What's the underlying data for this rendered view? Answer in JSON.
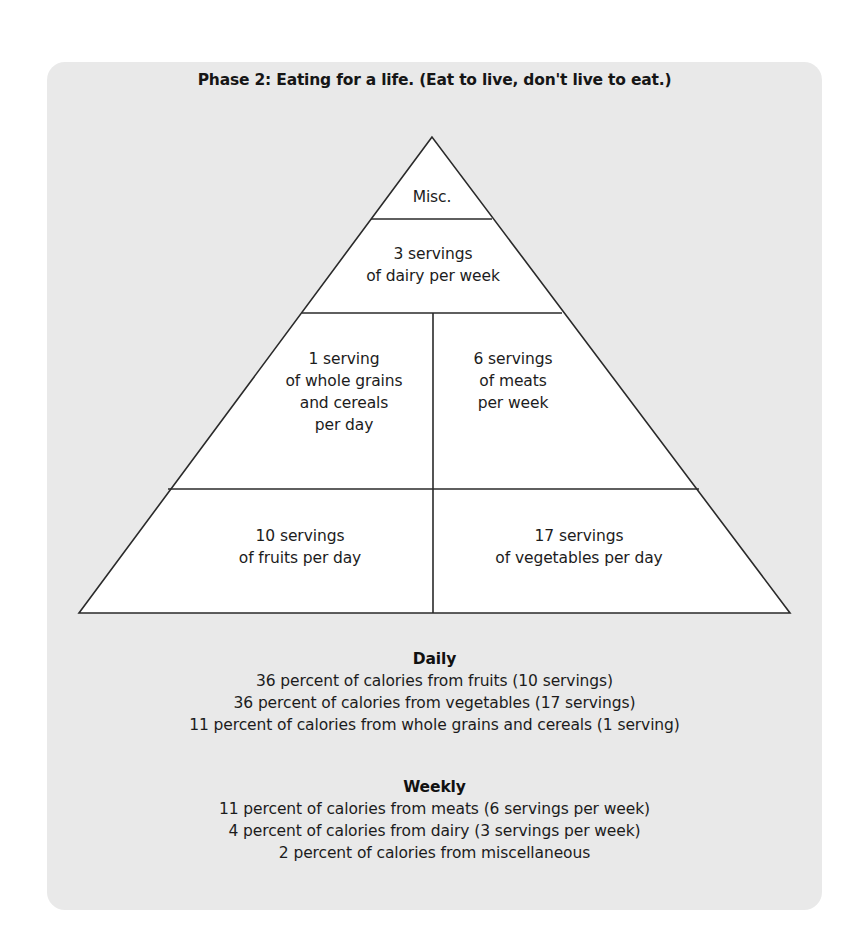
{
  "title": "Phase 2: Eating for a life. (Eat to live, don't live to eat.)",
  "colors": {
    "panel_background": "#e9e9e9",
    "pyramid_fill": "#ffffff",
    "stroke": "#2a2a2a",
    "text": "#1c1c1c"
  },
  "pyramid": {
    "tiers": [
      {
        "id": "misc",
        "lines": [
          "Misc."
        ]
      },
      {
        "id": "dairy",
        "lines": [
          "3 servings",
          "of dairy per week"
        ]
      },
      {
        "id": "grains",
        "lines": [
          "1 serving",
          "of whole grains",
          "and cereals",
          "per day"
        ]
      },
      {
        "id": "meats",
        "lines": [
          "6 servings",
          "of meats",
          "per week"
        ]
      },
      {
        "id": "fruits",
        "lines": [
          "10 servings",
          "of fruits per day"
        ]
      },
      {
        "id": "vegetables",
        "lines": [
          "17 servings",
          "of vegetables per day"
        ]
      }
    ]
  },
  "daily": {
    "heading": "Daily",
    "lines": [
      "36 percent of calories from fruits (10 servings)",
      "36 percent of calories from vegetables (17 servings)",
      "11 percent of calories from whole grains and cereals (1 serving)"
    ]
  },
  "weekly": {
    "heading": "Weekly",
    "lines": [
      "11 percent of calories from meats (6 servings per week)",
      "4 percent of calories from dairy (3 servings per week)",
      "2 percent of calories from miscellaneous"
    ]
  }
}
